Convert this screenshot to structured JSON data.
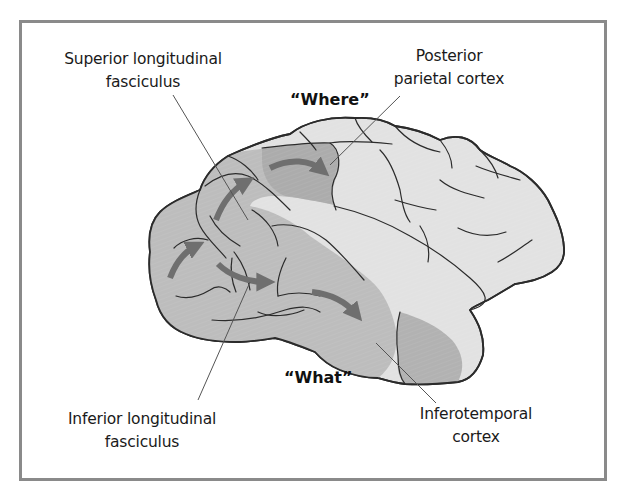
{
  "figure": {
    "colors": {
      "frame": "#8a8a8a",
      "brain_light": "#e2e2e2",
      "brain_shaded": "#bdbdbd",
      "region_highlight": "#a9a9a9",
      "arrow": "#6f6f6f",
      "outline": "#2b2b2b",
      "leader_line": "#555555"
    },
    "labels": {
      "superior_line1": "Superior longitudinal",
      "superior_line2": "fasciculus",
      "posterior_line1": "Posterior",
      "posterior_line2": "parietal cortex",
      "inferior_line1": "Inferior longitudinal",
      "inferior_line2": "fasciculus",
      "inferotemporal_line1": "Inferotemporal",
      "inferotemporal_line2": "cortex"
    },
    "streams": {
      "dorsal": "“Where”",
      "ventral": "“What”"
    }
  }
}
